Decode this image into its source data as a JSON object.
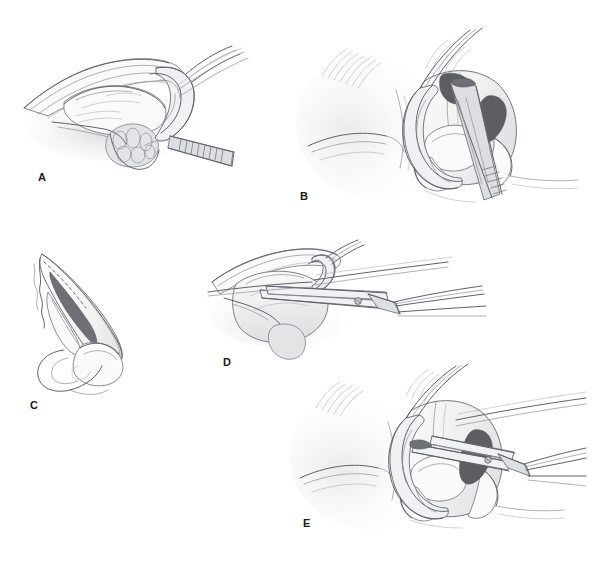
{
  "figure": {
    "background_color": "#ffffff",
    "width": 594,
    "height": 562,
    "style": "grayscale pencil medical line illustration",
    "panel_count": 5
  },
  "panels": [
    {
      "id": "A",
      "label": "A",
      "label_x": 38,
      "label_y": 172,
      "view": "lateral oblique",
      "description": "Lateral oblique view of the nasal tip with soft tissue elevated, exposing the lower lateral cartilage; a double-prong retractor hook lifts the alar rim while a serrated forceps grasps the tissue from the right.",
      "instruments": [
        "double-prong retractor hook",
        "serrated forceps"
      ],
      "accent_color": "#5f6268"
    },
    {
      "id": "B",
      "label": "B",
      "label_x": 300,
      "label_y": 196,
      "view": "frontal",
      "description": "Frontal view of the nose and face with retractor ring elevating the nasal tip; a serrated forceps is introduced into the nostril. Nostril apertures shown in dark grey.",
      "instruments": [
        "retractor ring",
        "serrated forceps"
      ],
      "accent_color": "#5c5e62"
    },
    {
      "id": "C",
      "label": "C",
      "label_x": 30,
      "label_y": 405,
      "view": "lateral profile",
      "description": "Lateral profile diagram of the nose showing the dorsal septal cartilage region shaded dark grey, with a dashed resection line along the dorsum.",
      "instruments": [],
      "accent_color": "#6e7075"
    },
    {
      "id": "D",
      "label": "D",
      "label_x": 223,
      "label_y": 362,
      "view": "lateral oblique",
      "description": "Lateral oblique close-up showing straight surgical scissors with a visible pivot screw trimming the exposed cartilage while a retractor hook elevates the tip.",
      "instruments": [
        "straight surgical scissors",
        "retractor hook"
      ],
      "accent_color": "#5f6268"
    },
    {
      "id": "E",
      "label": "E",
      "label_x": 303,
      "label_y": 523,
      "view": "frontal",
      "description": "Frontal view of the nose with the retractor ring in place and surgical scissors entering the nostril to resect cartilage; nostril aperture shown in dark grey.",
      "instruments": [
        "retractor ring",
        "surgical scissors"
      ],
      "accent_color": "#5c5e62"
    }
  ]
}
